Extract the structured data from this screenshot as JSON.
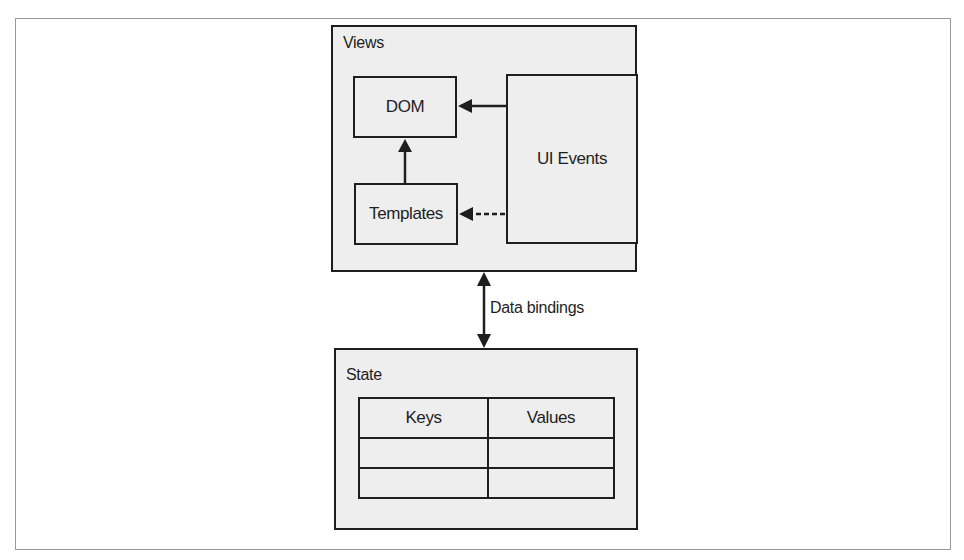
{
  "diagram": {
    "views": {
      "label": "Views",
      "nodes": {
        "dom": "DOM",
        "templates": "Templates",
        "ui_events": "UI Events"
      }
    },
    "state": {
      "label": "State",
      "table": {
        "headers": [
          "Keys",
          "Values"
        ],
        "rows": [
          [
            "",
            ""
          ],
          [
            "",
            ""
          ]
        ]
      }
    },
    "edges": [
      {
        "from": "UI Events",
        "to": "DOM",
        "style": "solid"
      },
      {
        "from": "UI Events",
        "to": "Templates",
        "style": "dashed"
      },
      {
        "from": "Templates",
        "to": "DOM",
        "style": "solid"
      },
      {
        "from": "Views",
        "to": "State",
        "style": "solid",
        "bidirectional": true,
        "label": "Data bindings"
      }
    ],
    "connector_label": "Data bindings",
    "colors": {
      "box_fill": "#eeeeee",
      "stroke": "#1e1e1e",
      "frame": "#9a9a9a"
    }
  }
}
